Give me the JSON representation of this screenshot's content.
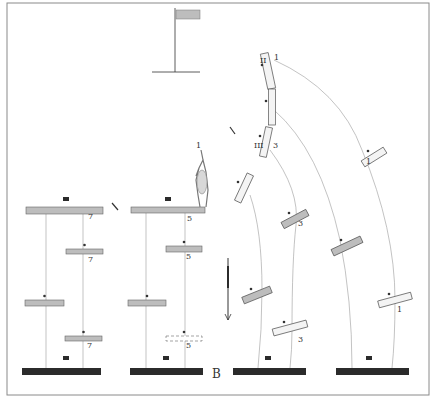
{
  "figure": {
    "frame": {
      "x": 7,
      "y": 3,
      "w": 422,
      "h": 392,
      "stroke": "#8a8a8a"
    },
    "colors": {
      "ink": "#333333",
      "bar_fill": "#bdbdbd",
      "bar_dark": "#2b2b2b",
      "bar_light": "#f4f4f4",
      "line": "#9a9a9a"
    },
    "flag": {
      "pole_x": 175,
      "pole_top": 8,
      "ground_y": 72,
      "ground_x1": 152,
      "ground_x2": 200,
      "flag_x": 176,
      "flag_y": 10,
      "flag_w": 24,
      "flag_h": 9
    },
    "panel_label": "B",
    "panel_label_pos": {
      "x": 212,
      "y": 378
    },
    "ground_bars": [
      {
        "x": 22,
        "y": 368,
        "w": 79,
        "h": 7,
        "marker_x": 66,
        "marker_y": 358
      },
      {
        "x": 130,
        "y": 368,
        "w": 73,
        "h": 7,
        "marker_x": 166,
        "marker_y": 358
      },
      {
        "x": 233,
        "y": 368,
        "w": 73,
        "h": 7,
        "marker_x": 268,
        "marker_y": 358
      },
      {
        "x": 336,
        "y": 368,
        "w": 73,
        "h": 7,
        "marker_x": 369,
        "marker_y": 358
      }
    ],
    "left_panel": {
      "top_bar": {
        "x": 26,
        "y": 207,
        "w": 77,
        "h": 7,
        "marker_x": 66,
        "marker_y": 199
      },
      "tick_mark": {
        "x1": 112,
        "y1": 203,
        "x2": 118,
        "y2": 210
      },
      "bars": [
        {
          "x": 66,
          "y": 249,
          "w": 37,
          "h": 5,
          "label": "7",
          "label_x": 88,
          "label_y": 262
        },
        {
          "x": 25,
          "y": 300,
          "w": 39,
          "h": 6,
          "label": "",
          "label_x": 0,
          "label_y": 0
        },
        {
          "x": 65,
          "y": 336,
          "w": 37,
          "h": 5,
          "label": "7",
          "label_x": 87,
          "label_y": 348
        }
      ],
      "top_label": "7",
      "top_label_pos": {
        "x": 88,
        "y": 219
      },
      "lines": [
        {
          "x1": 46,
          "y1": 214,
          "x2": 46,
          "y2": 368
        },
        {
          "x1": 83,
          "y1": 214,
          "x2": 83,
          "y2": 368
        }
      ]
    },
    "middle_panel": {
      "top_bar": {
        "x": 131,
        "y": 207,
        "w": 74,
        "h": 6,
        "marker_x": 168,
        "marker_y": 199
      },
      "bars": [
        {
          "x": 166,
          "y": 246,
          "w": 36,
          "h": 6,
          "label": "5",
          "label_x": 186,
          "label_y": 259
        },
        {
          "x": 128,
          "y": 300,
          "w": 38,
          "h": 6,
          "label": "",
          "label_x": 0,
          "label_y": 0
        },
        {
          "x": 166,
          "y": 336,
          "w": 36,
          "h": 5,
          "label": "5",
          "label_x": 186,
          "label_y": 348,
          "dashed": true
        }
      ],
      "top_label": "5",
      "top_label_pos": {
        "x": 187,
        "y": 221
      },
      "figure_label": "1",
      "figure_label_pos": {
        "x": 196,
        "y": 148
      },
      "arrow": {
        "x": 228,
        "y1": 258,
        "y2": 320
      },
      "lines": [
        {
          "x1": 146,
          "y1": 213,
          "x2": 146,
          "y2": 368
        },
        {
          "x1": 185,
          "y1": 213,
          "x2": 185,
          "y2": 368
        }
      ]
    },
    "right_panel": {
      "labels": [
        {
          "text": "II",
          "x": 260,
          "y": 63
        },
        {
          "text": "1",
          "x": 274,
          "y": 60
        },
        {
          "text": "III",
          "x": 254,
          "y": 148
        },
        {
          "text": "3",
          "x": 273,
          "y": 148
        },
        {
          "text": "3",
          "x": 298,
          "y": 226
        },
        {
          "text": "1",
          "x": 366,
          "y": 164
        },
        {
          "text": "3",
          "x": 298,
          "y": 342
        },
        {
          "text": "1",
          "x": 397,
          "y": 312
        }
      ],
      "tilted_bars": [
        {
          "cx": 268,
          "cy": 71,
          "w": 8,
          "h": 36,
          "angle": -12,
          "fill": "light"
        },
        {
          "cx": 272,
          "cy": 107,
          "w": 7,
          "h": 36,
          "angle": 0,
          "fill": "light"
        },
        {
          "cx": 266,
          "cy": 142,
          "w": 7,
          "h": 30,
          "angle": 12,
          "fill": "light"
        },
        {
          "cx": 244,
          "cy": 188,
          "w": 7,
          "h": 30,
          "angle": 25,
          "fill": "light"
        },
        {
          "cx": 295,
          "cy": 219,
          "w": 28,
          "h": 7,
          "angle": -28,
          "fill": "gray"
        },
        {
          "cx": 374,
          "cy": 157,
          "w": 26,
          "h": 7,
          "angle": -32,
          "fill": "light"
        },
        {
          "cx": 257,
          "cy": 295,
          "w": 30,
          "h": 7,
          "angle": -22,
          "fill": "gray"
        },
        {
          "cx": 347,
          "cy": 246,
          "w": 32,
          "h": 7,
          "angle": -25,
          "fill": "gray"
        },
        {
          "cx": 290,
          "cy": 328,
          "w": 35,
          "h": 7,
          "angle": -15,
          "fill": "light"
        },
        {
          "cx": 395,
          "cy": 300,
          "w": 34,
          "h": 7,
          "angle": -15,
          "fill": "light"
        }
      ],
      "curves": [
        "M 274 60 Q 340 90 362 150 Q 395 230 395 300 Q 395 340 392 368",
        "M 274 110 Q 320 150 340 240 Q 352 300 352 368",
        "M 270 150 Q 300 190 296 225 Q 292 260 292 330 Q 292 350 290 368",
        "M 250 195 Q 262 230 262 290 Q 262 330 258 368"
      ]
    }
  }
}
